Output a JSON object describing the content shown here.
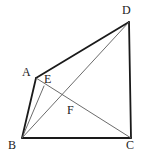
{
  "figure": {
    "canvas": {
      "width": 145,
      "height": 163
    },
    "background_color": "#ffffff",
    "stroke_color_outline": "#1a1a1a",
    "stroke_color_interior": "#5a5a5a",
    "stroke_width_outline": 1.8,
    "stroke_width_interior": 0.9,
    "points": {
      "A": {
        "label": "A",
        "x": 36,
        "y": 78,
        "label_x": 22,
        "label_y": 66
      },
      "B": {
        "label": "B",
        "x": 22,
        "y": 138,
        "label_x": 8,
        "label_y": 139
      },
      "C": {
        "label": "C",
        "x": 131,
        "y": 138,
        "label_x": 126,
        "label_y": 139
      },
      "D": {
        "label": "D",
        "x": 129,
        "y": 22,
        "label_x": 122,
        "label_y": 4
      },
      "E": {
        "label": "E",
        "x": 44,
        "y": 86,
        "label_x": 44,
        "label_y": 73
      },
      "F": {
        "label": "F",
        "x": 73,
        "y": 103,
        "label_x": 67,
        "label_y": 104
      }
    },
    "segments": [
      {
        "name": "side-AD",
        "from": "A",
        "to": "D",
        "style": "outline"
      },
      {
        "name": "side-DC",
        "from": "D",
        "to": "C",
        "style": "outline"
      },
      {
        "name": "side-CB",
        "from": "C",
        "to": "B",
        "style": "outline"
      },
      {
        "name": "side-BA",
        "from": "B",
        "to": "A",
        "style": "outline"
      },
      {
        "name": "diagonal-BD",
        "from": "B",
        "to": "D",
        "style": "interior"
      },
      {
        "name": "diagonal-AC",
        "from": "A",
        "to": "C",
        "style": "interior"
      },
      {
        "name": "cevian-BE",
        "from": "B",
        "to": "E",
        "style": "interior"
      }
    ]
  }
}
